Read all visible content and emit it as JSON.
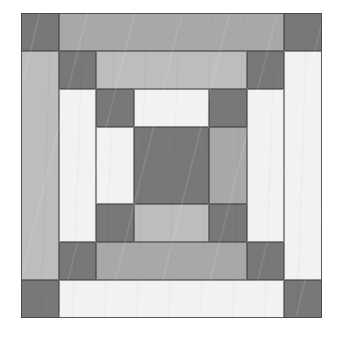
{
  "artwork": {
    "title": "Log Cabin Quilt Block",
    "kind": "quilt-block",
    "background_color": "#ffffff",
    "canvas": {
      "width": 346,
      "height": 341
    }
  },
  "palette": {
    "dark_gray": "#77787a",
    "medium_gray": "#a8a8a8",
    "light_gray": "#bdbdbd",
    "cream": "#f2f2f0",
    "outline": "#4a4a4a"
  },
  "grid": {
    "origin_x": 21,
    "origin_y": 13,
    "width": 301,
    "height": 305,
    "columns": 8,
    "rows": 8,
    "cell_width": 37.6,
    "cell_height": 38.1
  },
  "patches": [
    {
      "name": "corner-top-left-outer",
      "col": 0,
      "row": 0,
      "cols": 1,
      "rows": 1,
      "color": "#77787a"
    },
    {
      "name": "border-top-outer",
      "col": 1,
      "row": 0,
      "cols": 6,
      "rows": 1,
      "color": "#a8a8a8"
    },
    {
      "name": "corner-top-right-outer",
      "col": 7,
      "row": 0,
      "cols": 1,
      "rows": 1,
      "color": "#77787a"
    },
    {
      "name": "border-left-outer",
      "col": 0,
      "row": 1,
      "cols": 1,
      "rows": 6,
      "color": "#bdbdbd"
    },
    {
      "name": "border-right-outer",
      "col": 7,
      "row": 1,
      "cols": 1,
      "rows": 6,
      "color": "#f2f2f0"
    },
    {
      "name": "corner-bottom-left-outer",
      "col": 0,
      "row": 7,
      "cols": 1,
      "rows": 1,
      "color": "#77787a"
    },
    {
      "name": "border-bottom-outer",
      "col": 1,
      "row": 7,
      "cols": 6,
      "rows": 1,
      "color": "#f2f2f0"
    },
    {
      "name": "corner-bottom-right-outer",
      "col": 7,
      "row": 7,
      "cols": 1,
      "rows": 1,
      "color": "#77787a"
    },
    {
      "name": "corner-top-left-ring2",
      "col": 1,
      "row": 1,
      "cols": 1,
      "rows": 1,
      "color": "#77787a"
    },
    {
      "name": "border-top-ring2",
      "col": 2,
      "row": 1,
      "cols": 4,
      "rows": 1,
      "color": "#bdbdbd"
    },
    {
      "name": "corner-top-right-ring2",
      "col": 6,
      "row": 1,
      "cols": 1,
      "rows": 1,
      "color": "#77787a"
    },
    {
      "name": "border-left-ring2",
      "col": 1,
      "row": 2,
      "cols": 1,
      "rows": 4,
      "color": "#f2f2f0"
    },
    {
      "name": "border-right-ring2",
      "col": 6,
      "row": 2,
      "cols": 1,
      "rows": 4,
      "color": "#f2f2f0"
    },
    {
      "name": "corner-bottom-left-ring2",
      "col": 1,
      "row": 6,
      "cols": 1,
      "rows": 1,
      "color": "#77787a"
    },
    {
      "name": "border-bottom-ring2",
      "col": 2,
      "row": 6,
      "cols": 4,
      "rows": 1,
      "color": "#a8a8a8"
    },
    {
      "name": "corner-bottom-right-ring2",
      "col": 6,
      "row": 6,
      "cols": 1,
      "rows": 1,
      "color": "#77787a"
    },
    {
      "name": "corner-top-left-ring3",
      "col": 2,
      "row": 2,
      "cols": 1,
      "rows": 1,
      "color": "#77787a"
    },
    {
      "name": "border-top-ring3",
      "col": 3,
      "row": 2,
      "cols": 2,
      "rows": 1,
      "color": "#f2f2f0"
    },
    {
      "name": "corner-top-right-ring3",
      "col": 5,
      "row": 2,
      "cols": 1,
      "rows": 1,
      "color": "#77787a"
    },
    {
      "name": "border-left-ring3",
      "col": 2,
      "row": 3,
      "cols": 1,
      "rows": 2,
      "color": "#f2f2f0"
    },
    {
      "name": "border-right-ring3",
      "col": 5,
      "row": 3,
      "cols": 1,
      "rows": 2,
      "color": "#a8a8a8"
    },
    {
      "name": "corner-bottom-left-ring3",
      "col": 2,
      "row": 5,
      "cols": 1,
      "rows": 1,
      "color": "#77787a"
    },
    {
      "name": "border-bottom-ring3",
      "col": 3,
      "row": 5,
      "cols": 2,
      "rows": 1,
      "color": "#bdbdbd"
    },
    {
      "name": "corner-bottom-right-ring3",
      "col": 5,
      "row": 5,
      "cols": 1,
      "rows": 1,
      "color": "#77787a"
    },
    {
      "name": "center-square",
      "col": 3,
      "row": 3,
      "cols": 2,
      "rows": 2,
      "color": "#77787a"
    }
  ]
}
